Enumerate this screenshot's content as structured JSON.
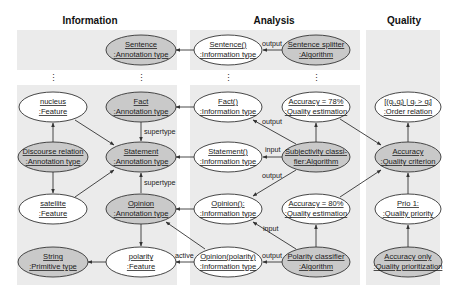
{
  "columns": [
    {
      "id": "information",
      "title": "Information"
    },
    {
      "id": "analysis",
      "title": "Analysis"
    },
    {
      "id": "quality",
      "title": "Quality"
    }
  ],
  "nodes": {
    "sentence_ann": {
      "line1": "Sentence",
      "line2": ":Annotation type",
      "style": "gray"
    },
    "sentence_info": {
      "line1": "Sentence()",
      "line2": ":Information type",
      "style": "white"
    },
    "sentence_splitter": {
      "line1": "Sentence splitter",
      "line2": ":Algorithm",
      "style": "gray"
    },
    "nucleus": {
      "line1": "nucleus",
      "line2": ":Feature",
      "style": "white"
    },
    "fact_ann": {
      "line1": "Fact",
      "line2": ":Annotation type",
      "style": "gray"
    },
    "fact_info": {
      "line1": "Fact()",
      "line2": ":Information type",
      "style": "white"
    },
    "acc78": {
      "line1": "Accuracy = 78%",
      "line2": ":Quality estimation",
      "style": "white"
    },
    "order_rel": {
      "line1": "[(qᵢ,qⱼ) | qᵢ > qⱼ]",
      "line2": ":Order relation",
      "style": "white"
    },
    "discourse": {
      "line1": "Discourse relation",
      "line2": ":Annotation type",
      "style": "gray"
    },
    "statement_ann": {
      "line1": "Statement",
      "line2": ":Annotation type",
      "style": "gray"
    },
    "statement_info": {
      "line1": "Statement()",
      "line2": ":Information type",
      "style": "white"
    },
    "subj_classifier": {
      "line1": "Subjectivity classi-",
      "line2": "fier:Algorithm",
      "style": "gray"
    },
    "acc_criterion": {
      "line1": "Accuracy",
      "line2": ":Quality criterion",
      "style": "gray"
    },
    "satellite": {
      "line1": "satellite",
      "line2": ":Feature",
      "style": "white"
    },
    "opinion_ann": {
      "line1": "Opinion",
      "line2": ":Annotation type",
      "style": "gray"
    },
    "opinion_info": {
      "line1": "Opinion():",
      "line2": ":Information type",
      "style": "white"
    },
    "acc80": {
      "line1": "Accuracy = 80%",
      "line2": ":Quality estimation",
      "style": "white"
    },
    "prio1": {
      "line1": "Prio 1:",
      "line2": ":Quality priority",
      "style": "white"
    },
    "string": {
      "line1": "String",
      "line2": ":Primitive type",
      "style": "gray"
    },
    "polarity": {
      "line1": "polarity",
      "line2": ":Feature",
      "style": "white"
    },
    "opinion_pol_info": {
      "line1": "Opinion(polarity)",
      "line2": ":Information type",
      "style": "white"
    },
    "pol_classifier": {
      "line1": "Polarity classifier",
      "line2": ":Algorithm",
      "style": "gray"
    },
    "acc_only": {
      "line1": "Accuracy only",
      "line2": ":Quality prioritization",
      "style": "gray"
    }
  },
  "edge_labels": {
    "output": "output",
    "input": "input",
    "supertype": "supertype",
    "active": "active",
    "ellipsis": "⋮"
  }
}
